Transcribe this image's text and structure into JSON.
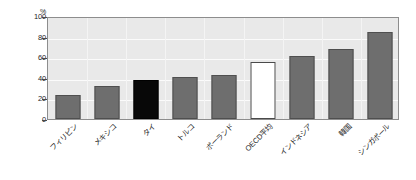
{
  "chart_data": {
    "type": "bar",
    "title": "",
    "subtitle": "",
    "xlabel": "",
    "ylabel": "",
    "yunit": "%",
    "ylim": [
      0,
      100
    ],
    "yticks": [
      0,
      20,
      40,
      60,
      80,
      100
    ],
    "grid": "horizontal-and-vertical",
    "legend": "none",
    "categories": [
      "フィリピン",
      "メキシコ",
      "タイ",
      "トルコ",
      "ポーランド",
      "OECD平均",
      "インドネシア",
      "韓国",
      "シンガポール"
    ],
    "values": [
      23,
      32,
      38,
      41,
      43,
      55,
      61,
      68,
      84
    ],
    "bar_styles": [
      "gray",
      "gray",
      "black",
      "gray",
      "gray",
      "white",
      "gray",
      "gray",
      "gray"
    ],
    "annotations": []
  },
  "colors": {
    "bar_gray": "#6e6e6e",
    "bar_black": "#080808",
    "bar_white": "#ffffff",
    "bar_outline": "#4f4f4f",
    "panel_background": "#e9e9e9",
    "panel_border": "#8d8d8d",
    "gridline": "#fbfbfb",
    "page_background": "#ffffff",
    "text": "#1f1f1f"
  }
}
